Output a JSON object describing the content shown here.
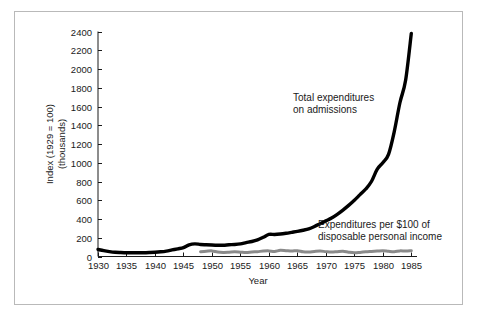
{
  "figure": {
    "background_color": "#ffffff",
    "frame_color": "#b9b9b9",
    "series_primary_color": "#000000",
    "series_secondary_color": "#8a8a8a"
  },
  "axes": {
    "x_title": "Year",
    "y_title_line1": "Index (1929  =  100)",
    "y_title_line2": "(thousands)",
    "x_ticks": [
      "1930",
      "1935",
      "1940",
      "1945",
      "1950",
      "1955",
      "1960",
      "1965",
      "1970",
      "1975",
      "1980",
      "1985"
    ],
    "y_ticks": [
      "0",
      "200",
      "400",
      "600",
      "800",
      "1000",
      "1200",
      "1400",
      "1600",
      "1800",
      "2000",
      "2200",
      "2400"
    ]
  },
  "annotations": {
    "total_line1": "Total expenditures",
    "total_line2": "on admissions",
    "per100_line1": "Expenditures per $100 of",
    "per100_line2": "disposable personal income"
  },
  "chart_data": {
    "type": "line",
    "title": "",
    "xlabel": "Year",
    "ylabel": "Index (1929 = 100) (thousands)",
    "xlim": [
      1930,
      1986
    ],
    "ylim": [
      0,
      2400
    ],
    "grid": false,
    "legend": "inline-annotations",
    "x": [
      1930,
      1931,
      1932,
      1933,
      1934,
      1935,
      1936,
      1937,
      1938,
      1939,
      1940,
      1941,
      1942,
      1943,
      1944,
      1945,
      1946,
      1947,
      1948,
      1949,
      1950,
      1951,
      1952,
      1953,
      1954,
      1955,
      1956,
      1957,
      1958,
      1959,
      1960,
      1961,
      1962,
      1963,
      1964,
      1965,
      1966,
      1967,
      1968,
      1969,
      1970,
      1971,
      1972,
      1973,
      1974,
      1975,
      1976,
      1977,
      1978,
      1979,
      1980,
      1981,
      1982,
      1983,
      1984,
      1985
    ],
    "series": [
      {
        "name": "Total expenditures on admissions",
        "color": "#000000",
        "values": [
          75,
          62,
          52,
          45,
          42,
          40,
          40,
          40,
          40,
          42,
          45,
          50,
          58,
          70,
          82,
          95,
          125,
          135,
          128,
          125,
          122,
          120,
          120,
          125,
          128,
          135,
          148,
          160,
          178,
          205,
          235,
          235,
          240,
          248,
          258,
          268,
          280,
          295,
          320,
          350,
          380,
          410,
          450,
          495,
          545,
          600,
          660,
          720,
          800,
          930,
          1000,
          1090,
          1330,
          1640,
          1880,
          2380
        ]
      },
      {
        "name": "Expenditures per $100 of disposable personal income",
        "color": "#8a8a8a",
        "values": [
          null,
          null,
          null,
          null,
          null,
          null,
          null,
          null,
          null,
          null,
          null,
          null,
          null,
          null,
          null,
          null,
          null,
          null,
          52,
          56,
          60,
          48,
          44,
          46,
          50,
          46,
          42,
          48,
          52,
          58,
          60,
          54,
          66,
          62,
          58,
          62,
          50,
          48,
          54,
          58,
          52,
          48,
          52,
          56,
          46,
          40,
          44,
          50,
          54,
          58,
          62,
          56,
          52,
          60,
          58,
          62
        ]
      }
    ]
  }
}
